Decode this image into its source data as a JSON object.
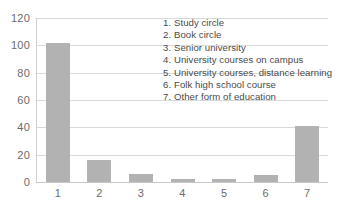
{
  "chart_data": {
    "type": "bar",
    "title": "",
    "xlabel": "",
    "ylabel": "",
    "categories": [
      "1",
      "2",
      "3",
      "4",
      "5",
      "6",
      "7"
    ],
    "values": [
      102,
      16,
      6,
      2,
      2,
      5,
      41
    ],
    "ylim": [
      0,
      120
    ],
    "yticks": [
      0,
      20,
      40,
      60,
      80,
      100,
      120
    ],
    "grid": true,
    "legend_position": "inside-top-right",
    "series": [
      {
        "name": "Number of participants",
        "values": [
          102,
          16,
          6,
          2,
          2,
          5,
          41
        ]
      }
    ],
    "legend_entries": [
      "1. Study circle",
      "2. Book circle",
      "3. Senior university",
      "4. University courses on campus",
      "5. University courses, distance learning",
      "6. Folk high school course",
      "7. Other form of education"
    ],
    "colors": {
      "bar_fill": "#b2b2b2",
      "gridline": "#d9d9d9",
      "tick_label": "#6b6b6b",
      "legend_text": "#4a4a4a",
      "background": "#ffffff"
    }
  },
  "axis": {
    "y_tick_labels": [
      "120",
      "100",
      "80",
      "60",
      "40",
      "20",
      "0"
    ],
    "x_tick_labels": [
      "1",
      "2",
      "3",
      "4",
      "5",
      "6",
      "7"
    ]
  },
  "legend": {
    "items": [
      {
        "number": "1.",
        "label": "Study circle"
      },
      {
        "number": "2.",
        "label": "Book circle"
      },
      {
        "number": "3.",
        "label": "Senior university"
      },
      {
        "number": "4.",
        "label": "University courses on campus"
      },
      {
        "number": "5.",
        "label": "University courses, distance learning"
      },
      {
        "number": "6.",
        "label": "Folk high school course"
      },
      {
        "number": "7.",
        "label": "Other form of education"
      }
    ]
  }
}
